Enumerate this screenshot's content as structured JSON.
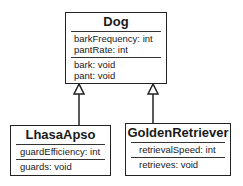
{
  "diagram": {
    "type": "uml-class-diagram",
    "classes": [
      {
        "name": "Dog",
        "attributes": [
          "barkFrequency: int",
          "pantRate: int"
        ],
        "operations": [
          "bark: void",
          "pant: void"
        ]
      },
      {
        "name": "LhasaApso",
        "attributes": [
          "guardEfficiency: int"
        ],
        "operations": [
          "guards: void"
        ]
      },
      {
        "name": "GoldenRetriever",
        "attributes": [
          "retrievalSpeed: int"
        ],
        "operations": [
          "retrieves: void"
        ]
      }
    ],
    "relationships": [
      {
        "type": "generalization",
        "from": "LhasaApso",
        "to": "Dog"
      },
      {
        "type": "generalization",
        "from": "GoldenRetriever",
        "to": "Dog"
      }
    ]
  }
}
